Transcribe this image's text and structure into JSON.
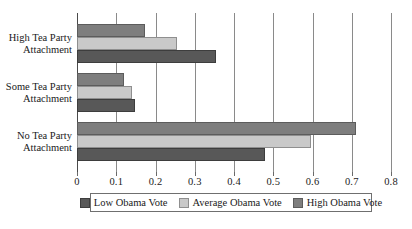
{
  "chart_data": {
    "type": "bar",
    "orientation": "horizontal",
    "title": "",
    "subtitle": "",
    "xlabel": "",
    "ylabel": "",
    "xlim": [
      0,
      0.8
    ],
    "xticks": [
      "0",
      "0.1",
      "0.2",
      "0.3",
      "0.4",
      "0.5",
      "0.6",
      "0.7",
      "0.8"
    ],
    "xtick_values": [
      0,
      0.1,
      0.2,
      0.3,
      0.4,
      0.5,
      0.6,
      0.7,
      0.8
    ],
    "grid": true,
    "grid_axis": "x",
    "legend_position": "bottom",
    "categories": [
      "High Tea Party Attachment",
      "Some Tea Party Attachment",
      "No Tea Party Attachment"
    ],
    "category_lines": [
      [
        "High Tea Party",
        "Attachment"
      ],
      [
        "Some Tea Party",
        "Attachment"
      ],
      [
        "No Tea Party",
        "Attachment"
      ]
    ],
    "series": [
      {
        "name": "Low Obama Vote",
        "color": "#585858",
        "values": [
          0.355,
          0.148,
          0.478
        ]
      },
      {
        "name": "Average Obama Vote",
        "color": "#c9c9c9",
        "values": [
          0.255,
          0.14,
          0.597
        ]
      },
      {
        "name": "High Obama Vote",
        "color": "#7e7e7e",
        "values": [
          0.172,
          0.12,
          0.71
        ]
      }
    ],
    "series_draw_order_top_to_bottom": [
      "High Obama Vote",
      "Average Obama Vote",
      "Low Obama Vote"
    ]
  },
  "legend": {
    "items": [
      {
        "label": "Low Obama Vote"
      },
      {
        "label": "Average Obama Vote"
      },
      {
        "label": "High Obama Vote"
      }
    ]
  }
}
